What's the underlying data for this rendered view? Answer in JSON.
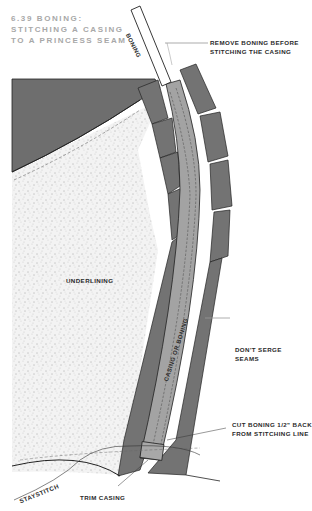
{
  "figure": {
    "title_lines": [
      "6.39 Boning:",
      "Stitching a casing",
      "to a princess seam"
    ]
  },
  "labels": {
    "boning": "Boning",
    "remove_boning": [
      "Remove boning before",
      "stitching the casing"
    ],
    "underlining": "Underlining",
    "casing_or_boning": "Casing or boning",
    "dont_serge": [
      "Don't serge",
      "seams"
    ],
    "cut_boning": [
      "Cut boning 1/2\" back",
      "from stitching line"
    ],
    "staystitch": "Staystitch",
    "trim_casing": "Trim casing"
  },
  "colors": {
    "dark_fabric": "#6e6e6e",
    "seam_allowance": "#737373",
    "casing": "#a3a3a3",
    "underlining": "#f1f1f1",
    "title": "#a8a8a8",
    "boning": "#ffffff"
  }
}
